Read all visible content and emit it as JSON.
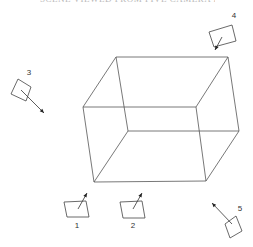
{
  "diagram": {
    "caption": "SCENE VIEWED FROM FIVE CAMERA POSITIONS",
    "colors": {
      "line": "#555555",
      "background": "#ffffff"
    },
    "cube": {
      "vertices": {
        "back_top_left": [
          116,
          57
        ],
        "back_top_right": [
          228,
          57
        ],
        "back_bottom_left": [
          128,
          131
        ],
        "back_bottom_right": [
          239,
          131
        ],
        "front_top_left": [
          83,
          107
        ],
        "front_top_right": [
          196,
          107
        ],
        "front_bottom_left": [
          94,
          182
        ],
        "front_bottom_right": [
          206,
          181
        ]
      }
    },
    "cameras": [
      {
        "id": "1",
        "label": "1",
        "box": [
          [
            64,
            202
          ],
          [
            86,
            201
          ],
          [
            89,
            217
          ],
          [
            67,
            217
          ]
        ],
        "ray": [
          [
            78,
            209
          ],
          [
            87,
            193
          ]
        ],
        "label_pos": [
          77,
          228
        ]
      },
      {
        "id": "2",
        "label": "2",
        "box": [
          [
            120,
            202
          ],
          [
            142,
            201
          ],
          [
            145,
            218
          ],
          [
            123,
            218
          ]
        ],
        "ray": [
          [
            133,
            209
          ],
          [
            142,
            193
          ]
        ],
        "label_pos": [
          133,
          228
        ]
      },
      {
        "id": "3",
        "label": "3",
        "box": [
          [
            18,
            79
          ],
          [
            31,
            87
          ],
          [
            26,
            101
          ],
          [
            11,
            94
          ]
        ],
        "ray": [
          [
            21,
            90
          ],
          [
            44,
            113
          ]
        ],
        "label_pos": [
          29,
          75
        ]
      },
      {
        "id": "4",
        "label": "4",
        "box": [
          [
            209,
            32
          ],
          [
            232,
            25
          ],
          [
            236,
            41
          ],
          [
            214,
            47
          ]
        ],
        "ray": [
          [
            222,
            37
          ],
          [
            215,
            50
          ]
        ],
        "label_pos": [
          234,
          18
        ]
      },
      {
        "id": "5",
        "label": "5",
        "box": [
          [
            225,
            224
          ],
          [
            236,
            216
          ],
          [
            242,
            231
          ],
          [
            230,
            238
          ]
        ],
        "ray": [
          [
            232,
            224
          ],
          [
            212,
            203
          ]
        ],
        "label_pos": [
          240,
          211
        ]
      }
    ]
  }
}
